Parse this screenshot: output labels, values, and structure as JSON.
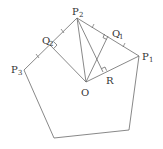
{
  "diagram": {
    "type": "geometry",
    "stroke_color": "#6a6a6a",
    "label_color": "#333333",
    "points": {
      "P1": {
        "x": 139,
        "y": 56,
        "label": "P",
        "sub": "1"
      },
      "P2": {
        "x": 77,
        "y": 18,
        "label": "P",
        "sub": "2"
      },
      "P3": {
        "x": 24,
        "y": 70,
        "label": "P",
        "sub": "3"
      },
      "O": {
        "x": 86,
        "y": 82,
        "label": "O"
      },
      "Q1": {
        "x": 108,
        "y": 36,
        "label": "Q",
        "sub": "1"
      },
      "Q2": {
        "x": 50,
        "y": 45,
        "label": "Q",
        "sub": "2"
      },
      "R": {
        "x": 103,
        "y": 72,
        "label": "R"
      },
      "B1": {
        "x": 54,
        "y": 138
      },
      "B2": {
        "x": 129,
        "y": 130
      }
    },
    "labels": {
      "p1": "P",
      "p1_sub": "1",
      "p2": "P",
      "p2_sub": "2",
      "p3": "P",
      "p3_sub": "3",
      "q1": "Q",
      "q1_sub": "1",
      "q2": "Q",
      "q2_sub": "2",
      "o": "O",
      "r": "R"
    },
    "polygon": [
      "P1",
      "P2",
      "P3",
      "B1",
      "B2"
    ],
    "segments": [
      [
        "O",
        "P1"
      ],
      [
        "O",
        "P2"
      ],
      [
        "O",
        "Q1"
      ],
      [
        "O",
        "Q2"
      ],
      [
        "P2",
        "R"
      ]
    ],
    "right_angles": [
      "Q1",
      "Q2",
      "R"
    ],
    "equal_tick_marks": [
      "P2-Q1",
      "Q1-P1",
      "P2-Q2",
      "Q2-P3"
    ]
  }
}
